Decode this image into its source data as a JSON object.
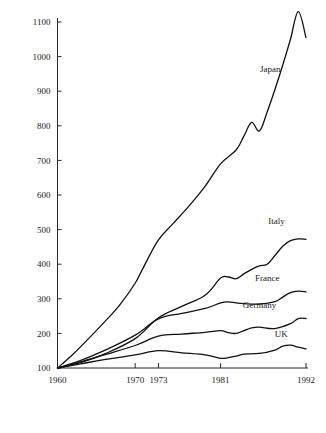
{
  "chart_data": {
    "type": "line",
    "title": "",
    "subtitle": "",
    "xlabel": "",
    "ylabel": "",
    "xlim": [
      1960,
      1992
    ],
    "ylim": [
      100,
      1130
    ],
    "grid": false,
    "legend_position": "inline-right-end-of-line",
    "x_tick_labels": [
      "1960",
      "1970",
      "1973",
      "1981",
      "1992"
    ],
    "x_ticks": [
      1960,
      1970,
      1973,
      1981,
      1992
    ],
    "y_tick_labels": [
      "100",
      "200",
      "300",
      "400",
      "500",
      "600",
      "700",
      "800",
      "900",
      "1000",
      "1100"
    ],
    "y_ticks": [
      100,
      200,
      300,
      400,
      500,
      600,
      700,
      800,
      900,
      1000,
      1100
    ],
    "series": [
      {
        "name": "Japan",
        "label": "Japan",
        "x": [
          1960,
          1962,
          1964,
          1966,
          1968,
          1970,
          1971,
          1973,
          1975,
          1977,
          1979,
          1981,
          1983,
          1984,
          1985,
          1986,
          1987,
          1988,
          1989,
          1990,
          1991,
          1992
        ],
        "values": [
          100,
          140,
          185,
          232,
          282,
          345,
          388,
          470,
          520,
          570,
          625,
          690,
          730,
          770,
          810,
          785,
          840,
          905,
          975,
          1050,
          1130,
          1055
        ]
      },
      {
        "name": "Italy",
        "label": "Italy",
        "x": [
          1960,
          1963,
          1966,
          1970,
          1973,
          1976,
          1979,
          1981,
          1982,
          1983,
          1984,
          1985,
          1986,
          1987,
          1988,
          1989,
          1990,
          1991,
          1992
        ],
        "values": [
          100,
          116,
          140,
          185,
          245,
          278,
          310,
          360,
          363,
          358,
          372,
          385,
          395,
          400,
          425,
          452,
          468,
          473,
          472
        ]
      },
      {
        "name": "France",
        "label": "France",
        "x": [
          1960,
          1963,
          1966,
          1970,
          1973,
          1976,
          1979,
          1981,
          1982,
          1983,
          1984,
          1986,
          1988,
          1989,
          1990,
          1991,
          1992
        ],
        "values": [
          100,
          122,
          150,
          195,
          242,
          258,
          272,
          288,
          291,
          288,
          286,
          285,
          292,
          305,
          318,
          322,
          320
        ]
      },
      {
        "name": "Germany",
        "label": "Germany",
        "x": [
          1960,
          1963,
          1966,
          1970,
          1973,
          1976,
          1979,
          1981,
          1982,
          1983,
          1984,
          1985,
          1986,
          1988,
          1990,
          1991,
          1992
        ],
        "values": [
          100,
          118,
          138,
          165,
          192,
          198,
          203,
          208,
          202,
          200,
          208,
          216,
          218,
          214,
          228,
          243,
          243
        ]
      },
      {
        "name": "UK",
        "label": "UK",
        "x": [
          1960,
          1963,
          1966,
          1970,
          1973,
          1976,
          1979,
          1981,
          1982,
          1983,
          1984,
          1986,
          1988,
          1989,
          1990,
          1991,
          1992
        ],
        "values": [
          100,
          112,
          124,
          138,
          150,
          144,
          138,
          128,
          130,
          134,
          140,
          142,
          152,
          163,
          166,
          160,
          155
        ]
      }
    ],
    "series_label_positions": [
      {
        "name": "Japan",
        "x": 1987.4,
        "y": 955
      },
      {
        "name": "Italy",
        "x": 1988.2,
        "y": 515
      },
      {
        "name": "France",
        "x": 1987.0,
        "y": 352
      },
      {
        "name": "Germany",
        "x": 1986.0,
        "y": 272
      },
      {
        "name": "UK",
        "x": 1988.8,
        "y": 190
      }
    ],
    "colors": {
      "line": "#111111",
      "axis": "#2b2b2b",
      "text": "#1a1a1a",
      "background": "#ffffff"
    }
  }
}
